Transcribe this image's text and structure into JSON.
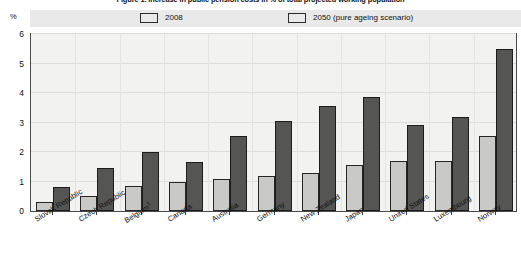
{
  "title": "Figure 1. Increase in public pension costs in % of total projected working population",
  "axis_unit": "%",
  "legend": {
    "items": [
      {
        "label": "2008",
        "color": "#c9c9c7"
      },
      {
        "label": "2050 (pure ageing scenario)",
        "color": "#555553"
      }
    ]
  },
  "yticks": [
    "0",
    "1",
    "2",
    "3",
    "4",
    "5",
    "6"
  ],
  "chart_data": {
    "type": "bar",
    "title": "Figure 1. Increase in public pension costs in % of total projected working population",
    "xlabel": "",
    "ylabel": "%",
    "ylim": [
      0,
      6
    ],
    "grid": true,
    "legend_position": "top",
    "categories": [
      "Slovak Republic",
      "Czech Republic",
      "Belgium¹",
      "Canada",
      "Australia",
      "Germany",
      "New Zealand",
      "Japan",
      "United States",
      "Luxembourg",
      "Norway"
    ],
    "series": [
      {
        "name": "2008",
        "color": "#c9c9c7",
        "values": [
          0.3,
          0.5,
          0.85,
          1.0,
          1.1,
          1.2,
          1.3,
          1.55,
          1.7,
          1.7,
          2.55
        ]
      },
      {
        "name": "2050 (pure ageing scenario)",
        "color": "#555553",
        "values": [
          0.8,
          1.45,
          2.0,
          1.65,
          2.55,
          3.05,
          3.55,
          3.85,
          2.9,
          3.2,
          5.5
        ]
      }
    ],
    "footnote_marker": "¹"
  }
}
